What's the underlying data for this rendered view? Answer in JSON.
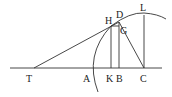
{
  "diagram": {
    "points": {
      "T": {
        "label": "T",
        "x": 34,
        "y": 68
      },
      "A": {
        "label": "A",
        "x": 92,
        "y": 68
      },
      "K": {
        "label": "K",
        "x": 111,
        "y": 68
      },
      "B": {
        "label": "B",
        "x": 119,
        "y": 68
      },
      "C": {
        "label": "C",
        "x": 144,
        "y": 68
      },
      "H": {
        "label": "H",
        "x": 111,
        "y": 26
      },
      "D": {
        "label": "D",
        "x": 119,
        "y": 22
      },
      "G": {
        "label": "G",
        "x": 120,
        "y": 28
      },
      "L": {
        "label": "L",
        "x": 144,
        "y": 15
      }
    },
    "colors": {
      "stroke": "#333333",
      "text": "#222222",
      "background": "#ffffff"
    }
  }
}
